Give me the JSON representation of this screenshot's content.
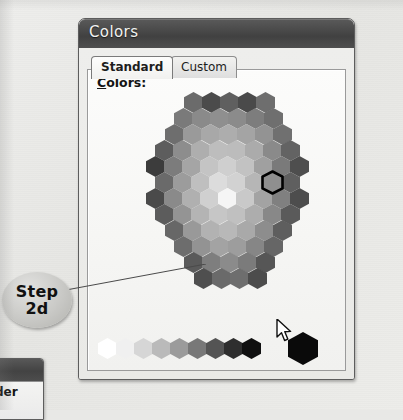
{
  "page": {
    "background_color": "#e8e8e6"
  },
  "dialog": {
    "title": "Colors",
    "tabs": [
      {
        "label": "Standard",
        "active": true
      },
      {
        "label": "Custom",
        "active": false
      }
    ],
    "colors_label": "Colors:",
    "colors_label_accelerator": "C",
    "selected_hex_index": 41,
    "current_color": "#000000"
  },
  "callout": {
    "line1": "Step",
    "line2": "2d"
  },
  "partial_window": {
    "label": "rder"
  },
  "icons": {
    "cursor": "mouse-pointer-icon"
  },
  "honeycomb": {
    "description": "Standard colors hexagonal palette, grayscale rendering",
    "hex_width": 19,
    "hex_height": 21,
    "rows": [
      {
        "count": 5,
        "offset_x": 96,
        "y": 0,
        "colors": [
          "#6b6b6b",
          "#4b4b4b",
          "#5f5f5f",
          "#4a4a4a",
          "#6e6e6e"
        ]
      },
      {
        "count": 6,
        "offset_x": 86,
        "y": 16,
        "colors": [
          "#7a7a7a",
          "#8a8a8a",
          "#8f8f8f",
          "#8b8b8b",
          "#7d7d7d",
          "#6f6f6f"
        ]
      },
      {
        "count": 7,
        "offset_x": 77,
        "y": 32,
        "colors": [
          "#6e6e6e",
          "#9a9a9a",
          "#a8a8a8",
          "#adadad",
          "#a4a4a4",
          "#939393",
          "#707070"
        ]
      },
      {
        "count": 8,
        "offset_x": 67,
        "y": 48,
        "colors": [
          "#5d5d5d",
          "#8d8d8d",
          "#aeaeae",
          "#bdbdbd",
          "#bcbcbc",
          "#ababab",
          "#8a8a8a",
          "#636363"
        ]
      },
      {
        "count": 9,
        "offset_x": 58,
        "y": 64,
        "colors": [
          "#3c3c3c",
          "#7c7c7c",
          "#a5a5a5",
          "#c4c4c4",
          "#cfcfcf",
          "#c2c2c2",
          "#a0a0a0",
          "#7a7a7a",
          "#4e4e4e"
        ]
      },
      {
        "count": 8,
        "offset_x": 67,
        "y": 80,
        "colors": [
          "#6a6a6a",
          "#9c9c9c",
          "#bfbfbf",
          "#dcdcdc",
          "#d2d2d2",
          "#b6b6b6",
          "#8f8f8f",
          "#5f5f5f"
        ]
      },
      {
        "count": 9,
        "offset_x": 58,
        "y": 96,
        "colors": [
          "#4a4a4a",
          "#8a8a8a",
          "#b0b0b0",
          "#d0d0d0",
          "#f5f5f5",
          "#c9c9c9",
          "#a3a3a3",
          "#808080",
          "#4d4d4d"
        ]
      },
      {
        "count": 8,
        "offset_x": 67,
        "y": 112,
        "colors": [
          "#5c5c5c",
          "#949494",
          "#b4b4b4",
          "#c6c6c6",
          "#c0c0c0",
          "#adadad",
          "#888888",
          "#5a5a5a"
        ]
      },
      {
        "count": 7,
        "offset_x": 77,
        "y": 128,
        "colors": [
          "#676767",
          "#999999",
          "#b2b2b2",
          "#b8b8b8",
          "#a9a9a9",
          "#8d8d8d",
          "#5e5e5e"
        ]
      },
      {
        "count": 6,
        "offset_x": 86,
        "y": 144,
        "colors": [
          "#6d6d6d",
          "#939393",
          "#a3a3a3",
          "#9d9d9d",
          "#868686",
          "#666666"
        ]
      },
      {
        "count": 5,
        "offset_x": 96,
        "y": 160,
        "colors": [
          "#5a5a5a",
          "#7e7e7e",
          "#8b8b8b",
          "#7b7b7b",
          "#565656"
        ]
      },
      {
        "count": 4,
        "offset_x": 106,
        "y": 176,
        "colors": [
          "#4f4f4f",
          "#6a6a6a",
          "#6e6e6e",
          "#4c4c4c"
        ]
      }
    ],
    "gray_strip": {
      "offset_x": 10,
      "y": 6,
      "colors": [
        "#ffffff",
        "#f0f0f0",
        "#d6d6d6",
        "#bababa",
        "#9b9b9b",
        "#787878",
        "#545454",
        "#2e2e2e",
        "#101010"
      ],
      "current_swatch_color": "#0a0a0a",
      "current_swatch_x": 200
    }
  }
}
